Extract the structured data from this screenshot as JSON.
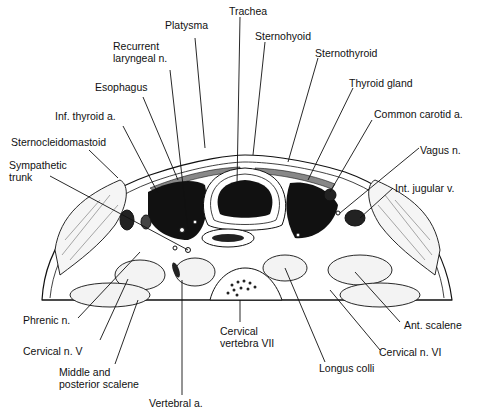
{
  "figure": {
    "labels": [
      {
        "id": "trachea",
        "text": "Trachea",
        "x": 229,
        "y": 5
      },
      {
        "id": "platysma",
        "text": "Platysma",
        "x": 165,
        "y": 19
      },
      {
        "id": "sternohyoid",
        "text": "Sternohyoid",
        "x": 255,
        "y": 30
      },
      {
        "id": "recurrent-laryngeal",
        "text": "Recurrent\nlaryngeal n.",
        "x": 113,
        "y": 40
      },
      {
        "id": "sternothyroid",
        "text": "Sternothyroid",
        "x": 315,
        "y": 47
      },
      {
        "id": "esophagus",
        "text": "Esophagus",
        "x": 95,
        "y": 81
      },
      {
        "id": "thyroid-gland",
        "text": "Thyroid gland",
        "x": 349,
        "y": 77
      },
      {
        "id": "inf-thyroid",
        "text": "Inf. thyroid a.",
        "x": 55,
        "y": 110
      },
      {
        "id": "common-carotid",
        "text": "Common carotid a.",
        "x": 374,
        "y": 108
      },
      {
        "id": "sternocleidomastoid",
        "text": "Sternocleidomastoid",
        "x": 11,
        "y": 136
      },
      {
        "id": "vagus",
        "text": "Vagus n.",
        "x": 420,
        "y": 144
      },
      {
        "id": "sympathetic",
        "text": "Sympathetic\ntrunk",
        "x": 9,
        "y": 159
      },
      {
        "id": "int-jugular",
        "text": "Int. jugular v.",
        "x": 395,
        "y": 182
      },
      {
        "id": "phrenic",
        "text": "Phrenic n.",
        "x": 23,
        "y": 314
      },
      {
        "id": "ant-scalene",
        "text": "Ant. scalene",
        "x": 404,
        "y": 319
      },
      {
        "id": "cervical-vertebra",
        "text": "Cervical\nvertebra VII",
        "x": 220,
        "y": 325
      },
      {
        "id": "cervical-v",
        "text": "Cervical n. V",
        "x": 23,
        "y": 345
      },
      {
        "id": "cervical-vi",
        "text": "Cervical n. VI",
        "x": 379,
        "y": 346
      },
      {
        "id": "longus-colli",
        "text": "Longus colli",
        "x": 319,
        "y": 362
      },
      {
        "id": "middle-posterior-scalene",
        "text": "Middle and\nposterior scalene",
        "x": 59,
        "y": 366
      },
      {
        "id": "vertebral",
        "text": "Vertebral a.",
        "x": 149,
        "y": 397
      }
    ]
  }
}
